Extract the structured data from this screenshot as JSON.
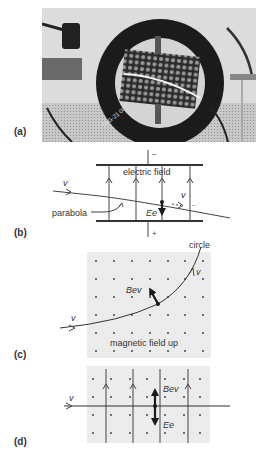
{
  "panels": {
    "a": {
      "label": "(a)",
      "type": "photo",
      "photo_stamp": "TAG-21 002"
    },
    "b": {
      "label": "(b)",
      "plate_top_sign": "−",
      "plate_bottom_sign": "+",
      "field_label": "electric field",
      "velocity_in": "v",
      "velocity_out": "v",
      "minus_mark": "-",
      "trajectory_label": "parabola",
      "force_label": "Ee"
    },
    "c": {
      "label": "(c)",
      "trajectory_label": "circle",
      "velocity_in": "v",
      "velocity_out": "v",
      "force_label": "Bev",
      "field_label": "magnetic field up"
    },
    "d": {
      "label": "(d)",
      "velocity_in": "v",
      "force_up_label": "Bev",
      "force_down_label": "Ee"
    }
  },
  "colors": {
    "line": "#444444",
    "field_bg": "#ececec",
    "dot": "#444444",
    "force_arrow": "#1a1a1a"
  }
}
